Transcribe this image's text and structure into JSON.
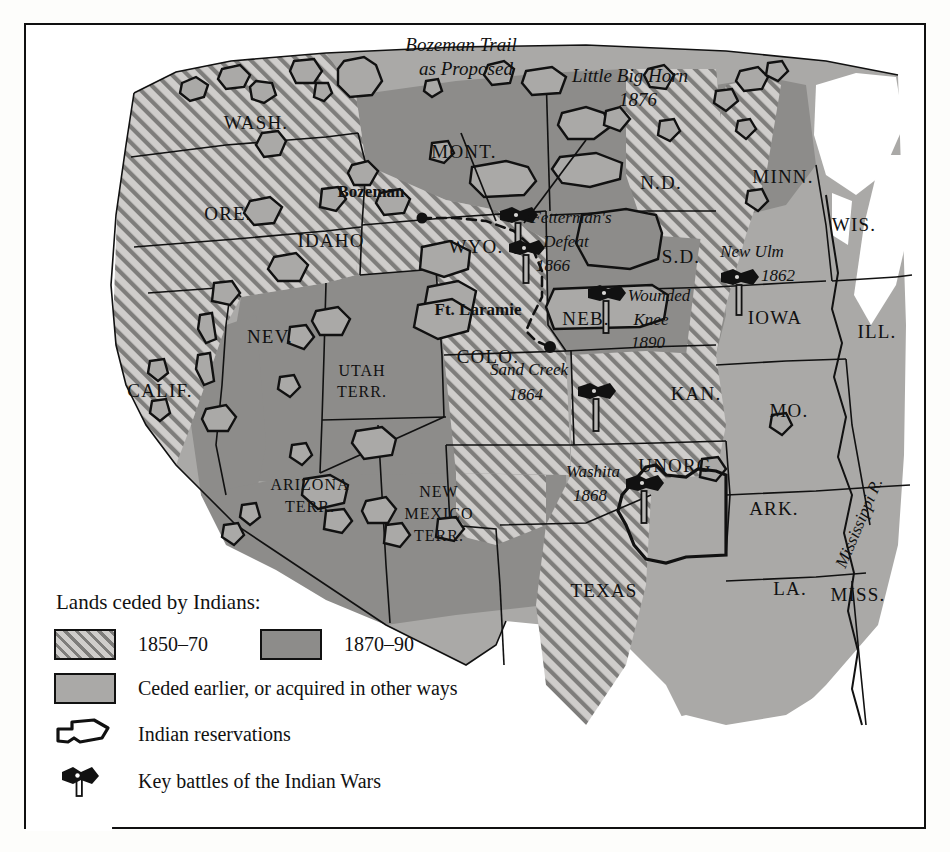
{
  "map": {
    "title_alt": "Lands ceded by Indians and key battles of the Indian Wars",
    "annotations": [
      {
        "id": "bozeman_trail",
        "line1": "Bozeman Trail",
        "line2": "as Proposed"
      },
      {
        "id": "little_big_horn",
        "line1": "Little Big Horn",
        "line2": "1876"
      }
    ],
    "cities": [
      {
        "name": "Bozeman"
      },
      {
        "name": "Ft. Laramie"
      }
    ],
    "battles": [
      {
        "name": "Little Big Horn",
        "year": "1876"
      },
      {
        "name": "Fetterman's Defeat",
        "name_line1": "Fetterman's",
        "name_line2": "Defeat",
        "year": "1866"
      },
      {
        "name": "New Ulm",
        "year": "1862"
      },
      {
        "name": "Wounded Knee",
        "name_line1": "Wounded",
        "name_line2": "Knee",
        "year": "1890"
      },
      {
        "name": "Sand Creek",
        "year": "1864"
      },
      {
        "name": "Washita",
        "year": "1868"
      }
    ],
    "rivers": [
      {
        "name": "Mississippi R."
      }
    ],
    "states": [
      {
        "label": "WASH."
      },
      {
        "label": "ORE."
      },
      {
        "label": "IDAHO"
      },
      {
        "label": "MONT."
      },
      {
        "label": "N.D."
      },
      {
        "label": "MINN."
      },
      {
        "label": "WIS."
      },
      {
        "label": "S.D."
      },
      {
        "label": "WYO."
      },
      {
        "label": "NEV."
      },
      {
        "label": "IOWA"
      },
      {
        "label": "ILL."
      },
      {
        "label": "NEB."
      },
      {
        "label": "CALIF."
      },
      {
        "label": "UTAH"
      },
      {
        "label": "TERR."
      },
      {
        "label": "COLO."
      },
      {
        "label": "KAN."
      },
      {
        "label": "MO."
      },
      {
        "label": "ARIZONA"
      },
      {
        "label": "NEW"
      },
      {
        "label": "MEXICO"
      },
      {
        "label": "UNORG."
      },
      {
        "label": "ARK."
      },
      {
        "label": "TEXAS"
      },
      {
        "label": "LA."
      },
      {
        "label": "MISS."
      }
    ],
    "state_labels": {
      "wash": "WASH.",
      "ore": "ORE.",
      "idaho": "IDAHO",
      "mont": "MONT.",
      "nd": "N.D.",
      "minn": "MINN.",
      "wis": "WIS.",
      "sd": "S.D.",
      "wyo": "WYO.",
      "nev": "NEV.",
      "iowa": "IOWA",
      "ill": "ILL.",
      "neb": "NEB.",
      "calif": "CALIF.",
      "utah1": "UTAH",
      "utah2": "TERR.",
      "colo": "COLO.",
      "kan": "KAN.",
      "mo": "MO.",
      "ariz1": "ARIZONA",
      "ariz2": "TERR.",
      "nm1": "NEW",
      "nm2": "MEXICO",
      "nm3": "TERR.",
      "unorg": "UNORG.",
      "ark": "ARK.",
      "texas": "TEXAS",
      "la": "LA.",
      "miss": "MISS."
    }
  },
  "legend": {
    "title": "Lands ceded by Indians:",
    "period_1_label": "1850–70",
    "period_2_label": "1870–90",
    "earlier_label": "Ceded earlier, or acquired in other ways",
    "reservations_label": "Indian reservations",
    "battles_label": "Key battles of the Indian Wars"
  },
  "colors": {
    "hatch_base": "#cfcdcb",
    "hatch_stripe": "#7e7d7b",
    "mid_gray": "#8d8c8a",
    "light_gray": "#aaa9a7",
    "ink": "#111111",
    "paper": "#ffffff"
  }
}
